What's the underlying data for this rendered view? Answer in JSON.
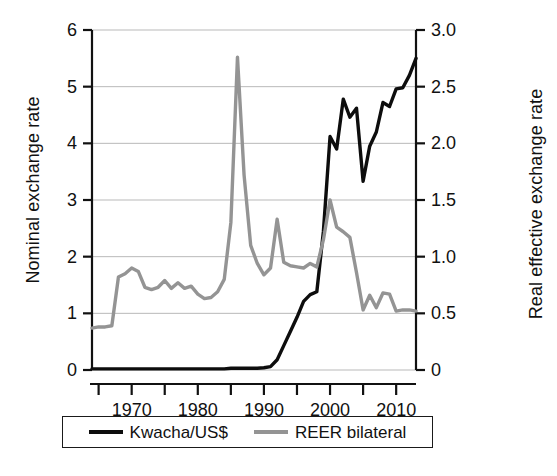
{
  "chart_data": {
    "type": "line",
    "title": "",
    "subtitle": "",
    "xlabel": "",
    "ylabel": "Nominal exchange rate",
    "y2label": "Real effective exchange rate",
    "xlim": [
      1964,
      2013
    ],
    "ylim": [
      0,
      6
    ],
    "y2lim": [
      0,
      3.0
    ],
    "grid": true,
    "grid_axis": "y",
    "legend_position": "bottom-outside",
    "xticks_major": [
      1970,
      1980,
      1990,
      2000,
      2010
    ],
    "xticks_minor": [
      1965,
      1975,
      1985,
      1995,
      2005
    ],
    "xtick_labels": [
      "1970",
      "1980",
      "1990",
      "2000",
      "2010"
    ],
    "yticks_left": [
      0,
      1,
      2,
      3,
      4,
      5,
      6
    ],
    "ytick_left_labels": [
      "0",
      "1",
      "2",
      "3",
      "4",
      "5",
      "6"
    ],
    "yticks_right": [
      0,
      0.5,
      1.0,
      1.5,
      2.0,
      2.5,
      3.0
    ],
    "ytick_right_labels": [
      "0",
      "0.5",
      "1.0",
      "1.5",
      "2.0",
      "2.5",
      "3.0"
    ],
    "x": [
      1964,
      1965,
      1966,
      1967,
      1968,
      1969,
      1970,
      1971,
      1972,
      1973,
      1974,
      1975,
      1976,
      1977,
      1978,
      1979,
      1980,
      1981,
      1982,
      1983,
      1984,
      1985,
      1986,
      1987,
      1988,
      1989,
      1990,
      1991,
      1992,
      1993,
      1994,
      1995,
      1996,
      1997,
      1998,
      1999,
      2000,
      2001,
      2002,
      2003,
      2004,
      2005,
      2006,
      2007,
      2008,
      2009,
      2010,
      2011,
      2012,
      2013
    ],
    "series": [
      {
        "name": "Kwacha/US$",
        "axis": "left",
        "color": "#0d0d0d",
        "width": 3.4,
        "values": [
          0.02,
          0.02,
          0.02,
          0.02,
          0.02,
          0.02,
          0.02,
          0.02,
          0.02,
          0.02,
          0.02,
          0.02,
          0.02,
          0.02,
          0.02,
          0.02,
          0.02,
          0.02,
          0.02,
          0.02,
          0.02,
          0.03,
          0.03,
          0.03,
          0.03,
          0.03,
          0.04,
          0.06,
          0.18,
          0.43,
          0.68,
          0.93,
          1.21,
          1.33,
          1.38,
          2.45,
          4.12,
          3.9,
          4.78,
          4.46,
          4.62,
          3.33,
          3.95,
          4.2,
          4.72,
          4.65,
          4.96,
          4.98,
          5.2,
          5.5
        ]
      },
      {
        "name": "REER bilateral",
        "axis": "right",
        "color": "#949494",
        "width": 3.4,
        "values": [
          0.37,
          0.38,
          0.38,
          0.39,
          0.82,
          0.85,
          0.9,
          0.87,
          0.73,
          0.71,
          0.73,
          0.79,
          0.72,
          0.77,
          0.72,
          0.74,
          0.67,
          0.63,
          0.64,
          0.69,
          0.8,
          1.3,
          2.76,
          1.72,
          1.1,
          0.94,
          0.84,
          0.9,
          1.33,
          0.95,
          0.92,
          0.91,
          0.9,
          0.94,
          0.91,
          1.15,
          1.5,
          1.26,
          1.22,
          1.17,
          0.86,
          0.53,
          0.66,
          0.55,
          0.68,
          0.67,
          0.52,
          0.53,
          0.53,
          0.52
        ]
      }
    ]
  },
  "legend": {
    "entries": [
      {
        "label": "Kwacha/US$",
        "swatch": "black-line-swatch"
      },
      {
        "label": "REER bilateral",
        "swatch": "gray-line-swatch"
      }
    ]
  }
}
